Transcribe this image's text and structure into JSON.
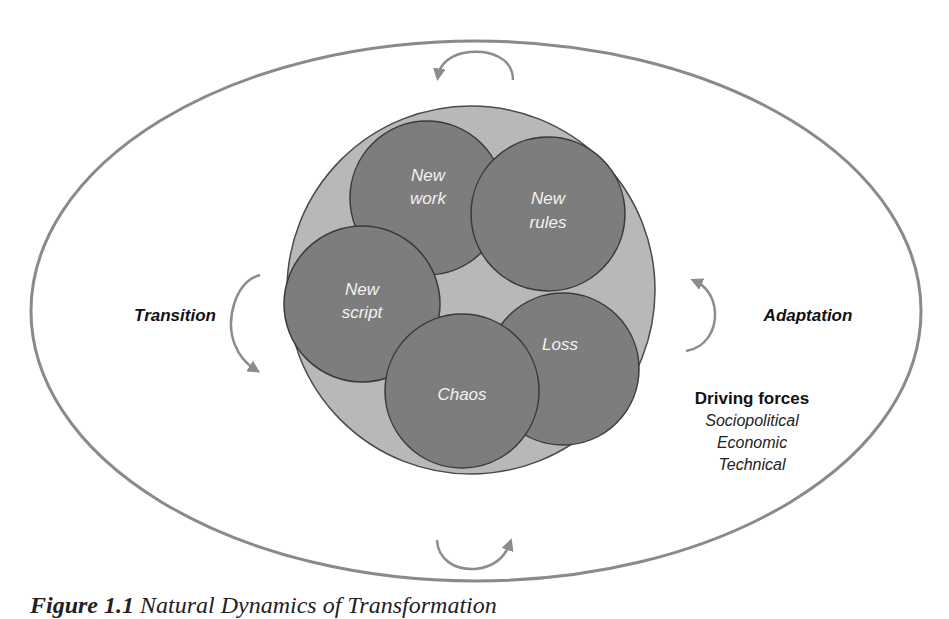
{
  "diagram": {
    "outer_labels": {
      "left": "Transition",
      "right": "Adaptation"
    },
    "inner_circles": [
      {
        "id": "new-work",
        "lines": [
          "New",
          "work"
        ]
      },
      {
        "id": "new-rules",
        "lines": [
          "New",
          "rules"
        ]
      },
      {
        "id": "new-script",
        "lines": [
          "New",
          "script"
        ]
      },
      {
        "id": "loss",
        "lines": [
          "Loss"
        ]
      },
      {
        "id": "chaos",
        "lines": [
          "Chaos"
        ]
      }
    ],
    "driving_forces": {
      "heading": "Driving forces",
      "items": [
        "Sociopolitical",
        "Economic",
        "Technical"
      ]
    },
    "colors": {
      "ellipse_stroke": "#8a8a8a",
      "outer_disc_fill": "#b8b8b8",
      "inner_circle_fill": "#7d7d7d",
      "inner_circle_stroke": "#3a3a3a",
      "inner_text": "#f2f2f2",
      "arrow": "#8c8c8c"
    }
  },
  "caption": {
    "figure_number": "Figure 1.1",
    "title": "Natural Dynamics of Transformation"
  }
}
